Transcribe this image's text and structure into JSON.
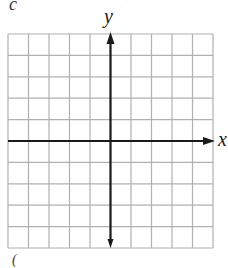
{
  "diagram": {
    "type": "coordinate-grid",
    "partial_label_top": "c",
    "partial_label_bottom": "(",
    "axes": {
      "x_label": "x",
      "y_label": "y"
    },
    "grid": {
      "columns": 10,
      "rows": 10,
      "origin_column": 5,
      "origin_row": 5,
      "tick_labels": false
    },
    "colors": {
      "grid_line": "#b0b0b0",
      "axis": "#1a1a1a",
      "background": "#ffffff"
    }
  }
}
